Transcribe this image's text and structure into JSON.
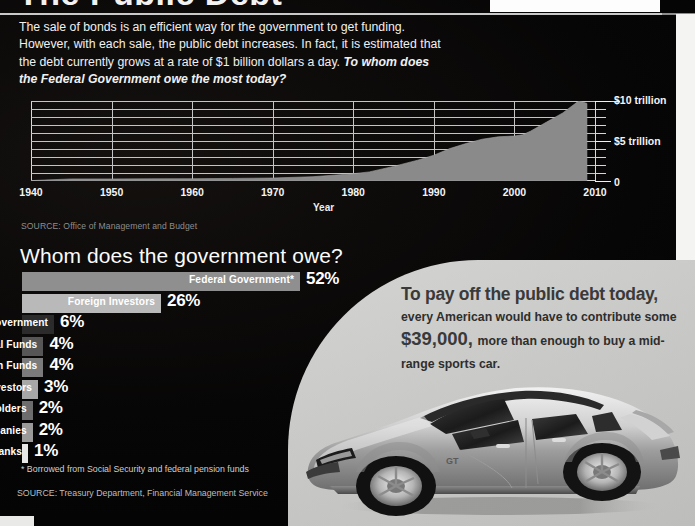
{
  "title": "The Public Debt",
  "intro": {
    "body": "The sale of bonds is an efficient way for the government to get funding. However, with each sale, the public debt increases. In fact, it is estimated that the debt currently grows at a rate of $1 billion dollars a day. ",
    "question": "To whom does the Federal Government owe the most today?"
  },
  "chart_data": [
    {
      "type": "area",
      "title": "",
      "xlabel": "Year",
      "ylabel": "",
      "xlim": [
        1940,
        2010
      ],
      "ylim": [
        0,
        10
      ],
      "grid": true,
      "ytick_labels": [
        "$10 trillion",
        "$5 trillion",
        "0"
      ],
      "ytick_values": [
        10,
        5,
        0
      ],
      "xtick_labels": [
        "1940",
        "1950",
        "1960",
        "1970",
        "1980",
        "1990",
        "2000",
        "2010"
      ],
      "units": "trillions of dollars",
      "x": [
        1940,
        1945,
        1950,
        1955,
        1960,
        1965,
        1970,
        1975,
        1980,
        1982,
        1985,
        1988,
        1990,
        1992,
        1994,
        1996,
        1998,
        2000,
        2001,
        2002,
        2004,
        2006,
        2008,
        2009
      ],
      "values": [
        0.05,
        0.26,
        0.26,
        0.27,
        0.29,
        0.32,
        0.38,
        0.54,
        0.91,
        1.14,
        1.82,
        2.6,
        3.23,
        4.06,
        4.69,
        5.22,
        5.53,
        5.63,
        5.77,
        6.23,
        7.38,
        8.51,
        10.02,
        9.7
      ],
      "series": [
        {
          "name": "Gross federal debt",
          "values": [
            0.05,
            0.26,
            0.26,
            0.27,
            0.29,
            0.32,
            0.38,
            0.54,
            0.91,
            1.14,
            1.82,
            2.6,
            3.23,
            4.06,
            4.69,
            5.22,
            5.53,
            5.63,
            5.77,
            6.23,
            7.38,
            8.51,
            10.02,
            9.7
          ]
        }
      ],
      "source": "SOURCE: Office of Management and Budget"
    },
    {
      "type": "bar",
      "title": "Whom does the government owe?",
      "orientation": "horizontal",
      "xlabel": "",
      "ylabel": "",
      "grid": false,
      "categories": [
        "Federal Government*",
        "Foreign Investors",
        "State and Local Government",
        "Mutual Funds",
        "Pension Funds",
        "Other Investors",
        "Bond Holders",
        "Insurance Companies",
        "Commercial Banks"
      ],
      "values": [
        52,
        26,
        6,
        4,
        4,
        3,
        2,
        2,
        1
      ],
      "value_labels": [
        "52%",
        "26%",
        "6%",
        "4%",
        "4%",
        "3%",
        "2%",
        "2%",
        "1%"
      ],
      "bar_colors": [
        "#8f8f8f",
        "#b9b9b9",
        "#2b2b2b",
        "#565656",
        "#7b7b7b",
        "#a7a7a7",
        "#6d6d6d",
        "#9a9a9a",
        "#e8e8e8"
      ],
      "footnote": "* Borrowed from Social Security and federal pension funds",
      "source": "SOURCE: Treasury Department, Financial Management Service"
    }
  ],
  "chart1": {
    "ylabels": {
      "top": "$10 trillion",
      "mid": "$5 trillion",
      "zero": "0"
    },
    "xlabels": [
      "1940",
      "1950",
      "1960",
      "1970",
      "1980",
      "1990",
      "2000",
      "2010"
    ],
    "axis_title": "Year",
    "source": "SOURCE: Office of Management and Budget"
  },
  "owe_section": {
    "heading": "Whom does the government owe?",
    "rows": [
      {
        "label": "Federal Government*",
        "value": "52%"
      },
      {
        "label": "Foreign Investors",
        "value": "26%"
      },
      {
        "label": "State and Local Government",
        "value": "6%"
      },
      {
        "label": "Mutual Funds",
        "value": "4%"
      },
      {
        "label": "Pension Funds",
        "value": "4%"
      },
      {
        "label": "Other Investors",
        "value": "3%"
      },
      {
        "label": "Bond Holders",
        "value": "2%"
      },
      {
        "label": "Insurance Companies",
        "value": "2%"
      },
      {
        "label": "Commercial Banks",
        "value": "1%"
      }
    ],
    "footnote": "* Borrowed from Social Security and federal pension funds",
    "source": "SOURCE: Treasury Department, Financial Management Service"
  },
  "callout": {
    "lead": "To pay off the public debt today,",
    "mid1": "every American would have to contribute some",
    "amount": "$39,000,",
    "mid2": "more than enough to buy a mid-range sports car."
  },
  "photo": {
    "alt": "silver sports car",
    "badge": "GT"
  },
  "colors": {
    "background": "#040404",
    "text": "#ffffff",
    "grid": "#c4c4c4",
    "area_fill": "#8a8a8a",
    "panel": "#c9c9c7"
  }
}
